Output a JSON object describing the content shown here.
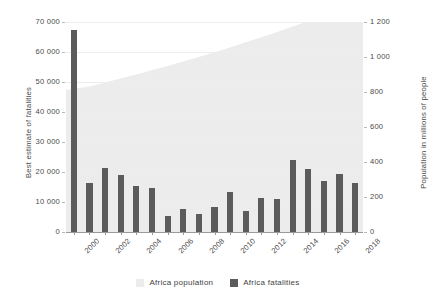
{
  "header_fragment": "",
  "axes": {
    "left_title": "Best estimate of fatalities",
    "right_title": "Population in millions of people",
    "left_ticks": [
      "70 000",
      "60 000",
      "50 000",
      "40 000",
      "30 000",
      "20 000",
      "10 000",
      "0"
    ],
    "right_ticks": [
      "1 200",
      "1 000",
      "800",
      "600",
      "400",
      "200",
      "0"
    ]
  },
  "legend": {
    "items": [
      {
        "label": "Africa population",
        "color": "#ececec",
        "type": "area"
      },
      {
        "label": "Africa fatalities",
        "color": "#5b5b5b",
        "type": "bar"
      }
    ]
  },
  "chart_data": {
    "type": "bar",
    "title": "",
    "xlabel": "",
    "ylabel": "Best estimate of fatalities",
    "y2label": "Population in millions of people",
    "grid": true,
    "legend_position": "bottom",
    "ylim": [
      0,
      70000
    ],
    "y2lim": [
      0,
      1200
    ],
    "x": [
      2000,
      2001,
      2002,
      2003,
      2004,
      2005,
      2006,
      2007,
      2008,
      2009,
      2010,
      2011,
      2012,
      2013,
      2014,
      2015,
      2016,
      2017,
      2018
    ],
    "categories": [
      "2000",
      "2001",
      "2002",
      "2003",
      "2004",
      "2005",
      "2006",
      "2007",
      "2008",
      "2009",
      "2010",
      "2011",
      "2012",
      "2013",
      "2014",
      "2015",
      "2016",
      "2017",
      "2018"
    ],
    "xtick_labels": [
      "2000",
      "2002",
      "2004",
      "2006",
      "2008",
      "2010",
      "2012",
      "2014",
      "2016",
      "2018"
    ],
    "series": [
      {
        "name": "Africa fatalities",
        "type": "bar",
        "axis": "left",
        "unit": "fatalities",
        "color": "#5b5b5b",
        "values": [
          67500,
          16500,
          21500,
          19000,
          15500,
          14700,
          5200,
          7800,
          6000,
          8500,
          13200,
          7000,
          11500,
          11000,
          24000,
          21000,
          17000,
          19500,
          16500
        ]
      },
      {
        "name": "Africa population",
        "type": "area",
        "axis": "right",
        "unit": "millions of people",
        "color": "#ececec",
        "values": [
          811,
          832,
          854,
          877,
          900,
          924,
          949,
          974,
          1000,
          1027,
          1055,
          1084,
          1113,
          1143,
          1174,
          1205,
          1237,
          1269,
          1290
        ]
      }
    ]
  }
}
